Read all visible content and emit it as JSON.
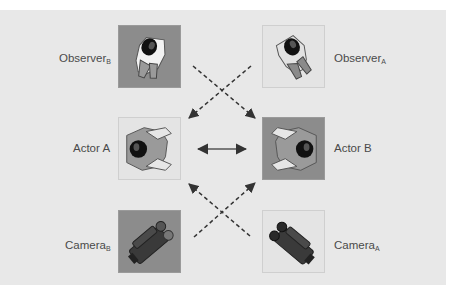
{
  "diagram": {
    "nodes": [
      {
        "id": "observer_b",
        "label": "Observer",
        "subscript": "B",
        "icon": "person-top-view-icon",
        "shade": "dark"
      },
      {
        "id": "observer_a",
        "label": "Observer",
        "subscript": "A",
        "icon": "person-top-view-icon",
        "shade": "light"
      },
      {
        "id": "actor_a",
        "label": "Actor A",
        "subscript": "",
        "icon": "person-top-view-icon",
        "shade": "light"
      },
      {
        "id": "actor_b",
        "label": "Actor B",
        "subscript": "",
        "icon": "person-top-view-icon",
        "shade": "dark"
      },
      {
        "id": "camera_b",
        "label": "Camera",
        "subscript": "B",
        "icon": "video-camera-icon",
        "shade": "dark"
      },
      {
        "id": "camera_a",
        "label": "Camera",
        "subscript": "A",
        "icon": "video-camera-icon",
        "shade": "light"
      }
    ],
    "edges": [
      {
        "from": "actor_a",
        "to": "actor_b",
        "style": "solid",
        "direction": "both"
      },
      {
        "from": "observer_b",
        "to": "actor_b",
        "style": "dashed",
        "direction": "forward"
      },
      {
        "from": "observer_a",
        "to": "actor_a",
        "style": "dashed",
        "direction": "forward"
      },
      {
        "from": "camera_b",
        "to": "actor_b",
        "style": "dashed",
        "direction": "forward"
      },
      {
        "from": "camera_a",
        "to": "actor_a",
        "style": "dashed",
        "direction": "forward"
      }
    ],
    "colors": {
      "background": "#e8e8e8",
      "dark_box": "#8c8c8c",
      "light_box": "#e4e4e4",
      "arrow": "#333333",
      "label_text": "#4a4a4a"
    }
  }
}
